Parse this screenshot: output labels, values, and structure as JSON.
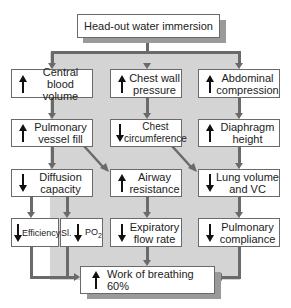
{
  "diagram": {
    "title": "Head-out water immersion",
    "rows": [
      [
        {
          "id": "central-blood-volume",
          "direction": "up",
          "line1": "Central",
          "line2": "blood volume"
        },
        {
          "id": "chest-wall-pressure",
          "direction": "up",
          "line1": "Chest wall",
          "line2": "pressure"
        },
        {
          "id": "abdominal-compression",
          "direction": "up",
          "line1": "Abdominal",
          "line2": "compression"
        }
      ],
      [
        {
          "id": "pulmonary-vessel-fill",
          "direction": "up",
          "line1": "Pulmonary",
          "line2": "vessel fill"
        },
        {
          "id": "chest-circumference",
          "direction": "down",
          "line1": "Chest",
          "line2": "circumference"
        },
        {
          "id": "diaphragm-height",
          "direction": "up",
          "line1": "Diaphragm",
          "line2": "height"
        }
      ],
      [
        {
          "id": "diffusion-capacity",
          "direction": "down",
          "line1": "Diffusion",
          "line2": "capacity"
        },
        {
          "id": "airway-resistance",
          "direction": "up",
          "line1": "Airway",
          "line2": "resistance"
        },
        {
          "id": "lung-volume-vc",
          "direction": "down",
          "line1": "Lung volume",
          "line2": "and VC"
        }
      ],
      [
        {
          "id": "efficiency",
          "direction": "down",
          "line1": "Efficiency"
        },
        {
          "id": "sl-po2",
          "direction": "down",
          "prefix": "Sl.",
          "line1": "PO",
          "sub": "2"
        },
        {
          "id": "expiratory-flow-rate",
          "direction": "down",
          "line1": "Expiratory",
          "line2": "flow rate"
        },
        {
          "id": "pulmonary-compliance",
          "direction": "down",
          "line1": "Pulmonary",
          "line2": "compliance"
        }
      ]
    ],
    "result": {
      "direction": "up",
      "label": "Work of breathing 60%"
    },
    "colors": {
      "band": "#d4d4d4",
      "line": "#6a6a6a",
      "shadow": "#9a9a9a",
      "box": "#ffffff"
    }
  }
}
